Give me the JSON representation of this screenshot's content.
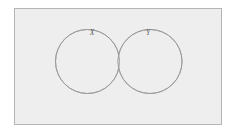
{
  "figure": {
    "kind": "venn-diagram",
    "title": "",
    "caption": "",
    "background_color": "#ffffff"
  },
  "universe": {
    "label": "",
    "fill_color": "#eeeeee",
    "border_color": "#b4b4b4",
    "x": 14,
    "y": 8,
    "width": 208,
    "height": 117
  },
  "sets": [
    {
      "id": "X",
      "label": "X",
      "label_x": 92,
      "label_y": 33,
      "center_x": 87.5,
      "center_y": 61.5,
      "radius": 32,
      "stroke_color": "#9a9a9a",
      "fill_color": "#eeeeee"
    },
    {
      "id": "Y",
      "label": "Y",
      "label_x": 148,
      "label_y": 33,
      "center_x": 150,
      "center_y": 61.5,
      "radius": 32,
      "stroke_color": "#9a9a9a",
      "fill_color": "#eeeeee"
    }
  ],
  "intersection": {
    "label": "",
    "shaded": true,
    "fill_color": "#ffffff",
    "stroke_color": "#9a9a9a"
  },
  "chart_data": {
    "type": "venn",
    "title": "",
    "xlabel": "",
    "ylabel": "",
    "set_labels": [
      "X",
      "Y"
    ],
    "regions": [
      {
        "name": "X only",
        "highlighted": false,
        "fill": "#eeeeee"
      },
      {
        "name": "Y only",
        "highlighted": false,
        "fill": "#eeeeee"
      },
      {
        "name": "X and Y",
        "highlighted": true,
        "fill": "#ffffff"
      },
      {
        "name": "universe outside X and Y",
        "highlighted": false,
        "fill": "#eeeeee"
      }
    ],
    "legend": [],
    "annotations": []
  }
}
